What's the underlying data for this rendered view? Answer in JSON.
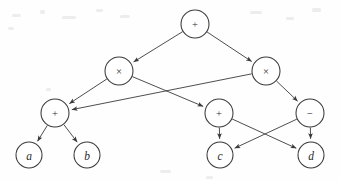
{
  "figure": {
    "background_color": "#fefefe",
    "stroke_color": "#3a3a3a",
    "node_fill_color": "#ffffff",
    "width": 340,
    "height": 180
  },
  "graph_data": {
    "type": "diagram",
    "diagram_kind": "directed-acyclic-graph",
    "node_radius": 14,
    "leaf_radius": 13,
    "nodes": [
      {
        "id": "root",
        "label": "+",
        "kind": "operator",
        "glyph": "plus-sign",
        "x": 195,
        "y": 24,
        "r": 14
      },
      {
        "id": "mulL",
        "label": "×",
        "kind": "operator",
        "glyph": "times-sign",
        "x": 119,
        "y": 71,
        "r": 14
      },
      {
        "id": "mulR",
        "label": "×",
        "kind": "operator",
        "glyph": "times-sign",
        "x": 266,
        "y": 71,
        "r": 14
      },
      {
        "id": "addL",
        "label": "+",
        "kind": "operator",
        "glyph": "plus-sign",
        "x": 55,
        "y": 113,
        "r": 14
      },
      {
        "id": "addM",
        "label": "+",
        "kind": "operator",
        "glyph": "plus-sign",
        "x": 219,
        "y": 113,
        "r": 14
      },
      {
        "id": "sub",
        "label": "−",
        "kind": "operator",
        "glyph": "minus-sign",
        "x": 310,
        "y": 113,
        "r": 14
      },
      {
        "id": "leafA",
        "label": "a",
        "kind": "leaf",
        "glyph": "variable-a",
        "x": 29,
        "y": 155,
        "r": 13
      },
      {
        "id": "leafB",
        "label": "b",
        "kind": "leaf",
        "glyph": "variable-b",
        "x": 87,
        "y": 155,
        "r": 13
      },
      {
        "id": "leafC",
        "label": "c",
        "kind": "leaf",
        "glyph": "variable-c",
        "x": 220,
        "y": 155,
        "r": 13
      },
      {
        "id": "leafD",
        "label": "d",
        "kind": "leaf",
        "glyph": "variable-d",
        "x": 311,
        "y": 155,
        "r": 13
      }
    ],
    "edges": [
      {
        "from": "root",
        "to": "mulL",
        "directed": true
      },
      {
        "from": "root",
        "to": "mulR",
        "directed": true
      },
      {
        "from": "mulL",
        "to": "addL",
        "directed": true
      },
      {
        "from": "mulL",
        "to": "addM",
        "directed": true
      },
      {
        "from": "mulR",
        "to": "addL",
        "directed": true
      },
      {
        "from": "mulR",
        "to": "sub",
        "directed": true
      },
      {
        "from": "addL",
        "to": "leafA",
        "directed": true
      },
      {
        "from": "addL",
        "to": "leafB",
        "directed": true
      },
      {
        "from": "addM",
        "to": "leafC",
        "directed": true
      },
      {
        "from": "addM",
        "to": "leafD",
        "directed": true
      },
      {
        "from": "sub",
        "to": "leafC",
        "directed": true
      },
      {
        "from": "sub",
        "to": "leafD",
        "directed": true
      }
    ],
    "specks": [
      {
        "x": 12,
        "y": 14,
        "w": 9,
        "h": 3
      },
      {
        "x": 40,
        "y": 10,
        "w": 5,
        "h": 4
      },
      {
        "x": 62,
        "y": 16,
        "w": 14,
        "h": 3
      },
      {
        "x": 96,
        "y": 9,
        "w": 7,
        "h": 3
      },
      {
        "x": 120,
        "y": 15,
        "w": 10,
        "h": 3
      },
      {
        "x": 250,
        "y": 11,
        "w": 12,
        "h": 3
      },
      {
        "x": 286,
        "y": 17,
        "w": 8,
        "h": 3
      },
      {
        "x": 312,
        "y": 8,
        "w": 9,
        "h": 4
      },
      {
        "x": 8,
        "y": 27,
        "w": 6,
        "h": 3
      },
      {
        "x": 160,
        "y": 170,
        "w": 11,
        "h": 3
      },
      {
        "x": 206,
        "y": 176,
        "w": 7,
        "h": 3
      },
      {
        "x": 46,
        "y": 88,
        "w": 5,
        "h": 3
      }
    ]
  }
}
